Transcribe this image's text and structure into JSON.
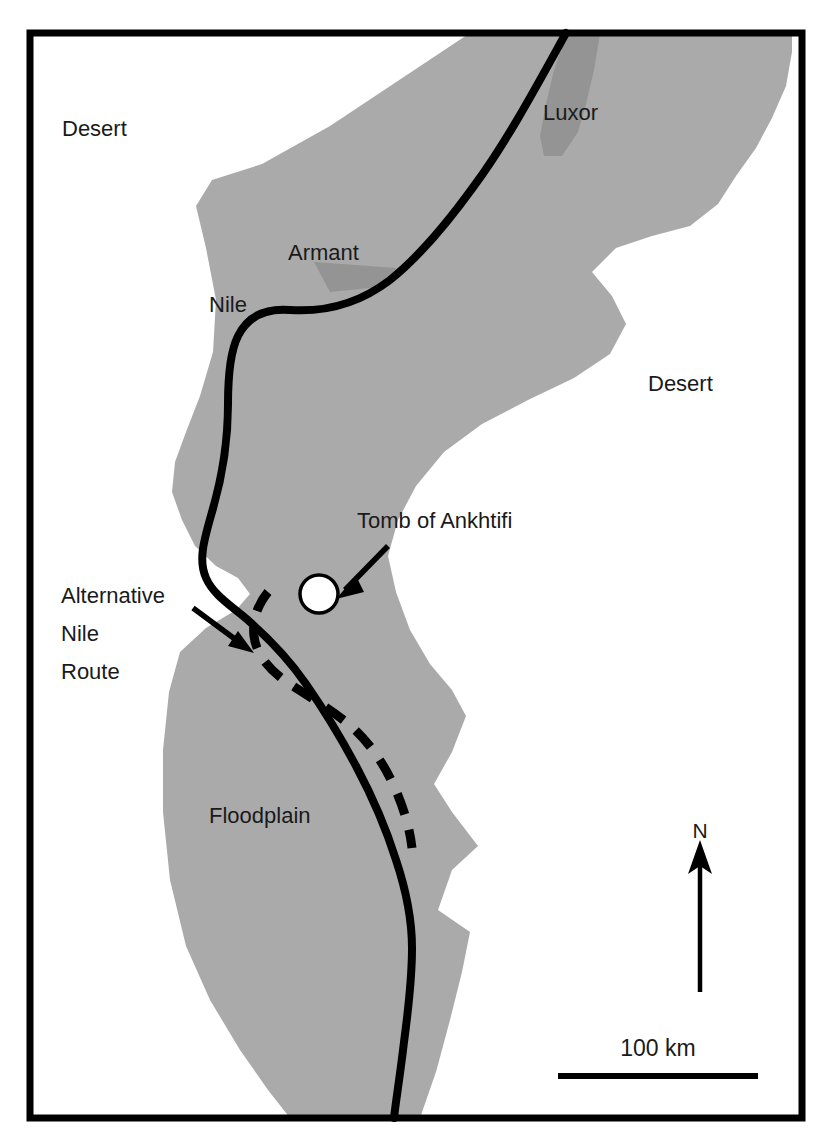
{
  "map": {
    "title_region": "Nile Valley near Luxor and Armant",
    "colors": {
      "floodplain_fill": "#aaaaaa",
      "city_fill": "#949494",
      "river_stroke": "#000000",
      "frame_stroke": "#000000",
      "text": "#1a1a1a",
      "background": "#ffffff"
    },
    "labels": {
      "desert_northwest": "Desert",
      "desert_east": "Desert",
      "luxor": "Luxor",
      "armant": "Armant",
      "nile": "Nile",
      "floodplain": "Floodplain",
      "tomb": "Tomb of Ankhtifi",
      "alternative_route_line1": "Alternative",
      "alternative_route_line2": "Nile",
      "alternative_route_line3": "Route"
    },
    "scale_bar": {
      "label": "100 km"
    },
    "north_arrow": {
      "label": "N"
    },
    "legend_features": [
      "Floodplain (grey shading)",
      "Nile river course (solid black line)",
      "Alternative Nile Route (dashed black line)",
      "Tomb of Ankhtifi (open circle marker)",
      "Cities: Luxor, Armant (dark grey patches)"
    ]
  }
}
